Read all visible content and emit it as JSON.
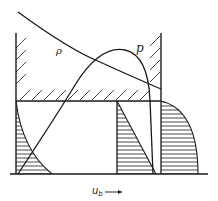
{
  "figure": {
    "labels": {
      "rho": "ρ",
      "p": "p",
      "x_axis_symbol": "u",
      "x_axis_subscript": "b"
    },
    "colors": {
      "ink": "#1a1a1a",
      "background": "#ffffff"
    }
  }
}
